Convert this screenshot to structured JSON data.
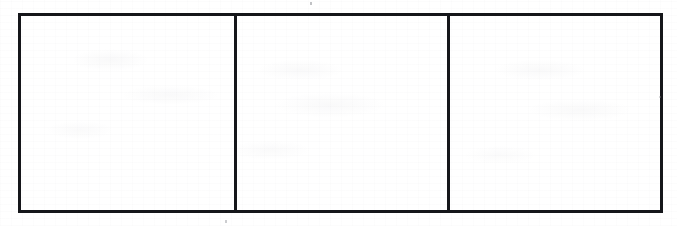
{
  "document": {
    "kind": "scanned-page",
    "media": "photocopy",
    "background_color": "#ffffff",
    "ink_color": "#15161a",
    "noise_color": "#8e9096",
    "width_px": 677,
    "height_px": 226
  },
  "table": {
    "border_color": "#15161a",
    "border_width_px": 3,
    "columns": 3,
    "rows": 1,
    "cells": [
      {
        "id": "cell-1",
        "text": "",
        "width_px": 216
      },
      {
        "id": "cell-2",
        "text": "",
        "width_px": 213
      },
      {
        "id": "cell-3",
        "text": "",
        "width_px": 213
      }
    ]
  },
  "artifacts": {
    "speck_top": "",
    "speck_bottom": "",
    "speck_right": ""
  }
}
